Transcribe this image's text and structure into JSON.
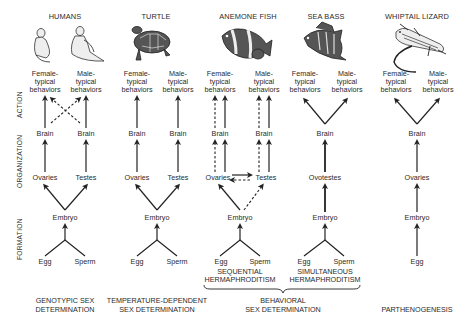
{
  "axis_labels": {
    "action": "ACTION",
    "organization": "ORGANIZATION",
    "formation": "FORMATION"
  },
  "columns": [
    {
      "species": "HUMANS",
      "icon": "humans-illustration",
      "behaviors": [
        "Female-",
        "typical",
        "behaviors",
        "Male-",
        "typical",
        "behaviors"
      ],
      "brain_left": "Brain",
      "brain_right": "Brain",
      "gonad_left": "Ovaries",
      "gonad_right": "Testes",
      "embryo": "Embryo",
      "egg": "Egg",
      "sperm": "Sperm",
      "caption": [
        "GENOTYPIC SEX",
        "DETERMINATION"
      ]
    },
    {
      "species": "TURTLE",
      "icon": "turtle-illustration",
      "behaviors": [
        "Female-",
        "typical",
        "behaviors",
        "Male-",
        "typical",
        "behaviors"
      ],
      "brain_left": "Brain",
      "brain_right": "Brain",
      "gonad_left": "Ovaries",
      "gonad_right": "Testes",
      "embryo": "Embryo",
      "egg": "Egg",
      "sperm": "Sperm",
      "caption": [
        "TEMPERATURE-DEPENDENT",
        "SEX DETERMINATION"
      ]
    },
    {
      "species": "ANEMONE FISH",
      "icon": "anemone-fish-illustration",
      "behaviors": [
        "Female-",
        "typical",
        "behaviors",
        "Male-",
        "typical",
        "behaviors"
      ],
      "brain_left": "Brain",
      "brain_right": "Brain",
      "gonad_left": "Ovaries",
      "gonad_right": "Testes",
      "embryo": "Embryo",
      "egg": "Egg",
      "sperm": "Sperm",
      "sub_caption": [
        "SEQUENTIAL",
        "HERMAPHRODITISM"
      ]
    },
    {
      "species": "SEA BASS",
      "icon": "sea-bass-illustration",
      "behaviors": [
        "Female-",
        "typical",
        "behaviors",
        "Male-",
        "typical",
        "behaviors"
      ],
      "brain": "Brain",
      "gonad": "Ovotestes",
      "embryo": "Embryo",
      "egg": "Egg",
      "sperm": "Sperm",
      "sub_caption": [
        "SIMULTANEOUS",
        "HERMAPHRODITISM"
      ]
    },
    {
      "species": "WHIPTAIL LIZARD",
      "icon": "whiptail-lizard-illustration",
      "behaviors": [
        "Female-",
        "typical",
        "behaviors",
        "Male-",
        "typical",
        "behaviors"
      ],
      "brain": "Brain",
      "gonad": "Ovaries",
      "embryo": "Embryo",
      "egg": "Egg",
      "caption": [
        "PARTHENOGENESIS"
      ]
    }
  ],
  "group_caption": [
    "BEHAVIORAL",
    "SEX DETERMINATION"
  ]
}
